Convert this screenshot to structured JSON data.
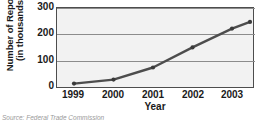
{
  "chart_data": {
    "type": "line",
    "title": "",
    "xlabel": "Year",
    "ylabel_line1": "Number of Reports",
    "ylabel_line2": "(in thousands)",
    "categories": [
      "1999",
      "2000",
      "2001",
      "2002",
      "2003",
      "2004"
    ],
    "values": [
      20,
      35,
      80,
      155,
      225,
      250
    ],
    "series": [
      {
        "name": "Number of Reports",
        "values": [
          20,
          35,
          80,
          155,
          225,
          250
        ]
      }
    ],
    "yticks": [
      "0",
      "100",
      "200",
      "300"
    ],
    "ytick_values": [
      0,
      100,
      200,
      300
    ],
    "ylim": [
      0,
      300
    ],
    "xlim": [
      "1999",
      "2004"
    ],
    "grid": "horizontal",
    "legend": "none",
    "line_color": "#4d4d4d",
    "marker_color": "#3a3a3a",
    "plot_background": "#f2f2f2",
    "axis_color": "#4d4d4d"
  },
  "caption": {
    "source": "Source: Federal Trade Commission"
  }
}
